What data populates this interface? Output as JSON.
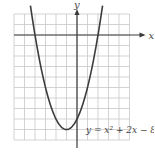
{
  "chart_data": {
    "type": "line",
    "title": "",
    "equation": "y = x^2 + 2x - 8",
    "equation_label": "y = x² + 2x − 8",
    "xlabel": "x",
    "ylabel": "y",
    "xlim": [
      -6,
      5
    ],
    "ylim": [
      -10,
      2
    ],
    "grid": true,
    "grid_step": 1,
    "axis_arrows": {
      "x": "right",
      "y": "up"
    },
    "series": [
      {
        "name": "y = x^2 + 2x - 8",
        "x": [
          -5.1,
          -5,
          -4,
          -3,
          -2,
          -1,
          0,
          1,
          2,
          3,
          3.1
        ],
        "y": [
          1.91,
          7,
          0,
          -5,
          -8,
          -9,
          -8,
          -5,
          0,
          7,
          1.91
        ]
      }
    ],
    "key_points": {
      "vertex": [
        -1,
        -9
      ],
      "x_intercepts": [
        [
          -4,
          0
        ],
        [
          2,
          0
        ]
      ],
      "y_intercept": [
        0,
        -8
      ]
    }
  },
  "labels": {
    "x_axis": "x",
    "y_axis": "y",
    "equation": "y = x² + 2x − 8"
  }
}
